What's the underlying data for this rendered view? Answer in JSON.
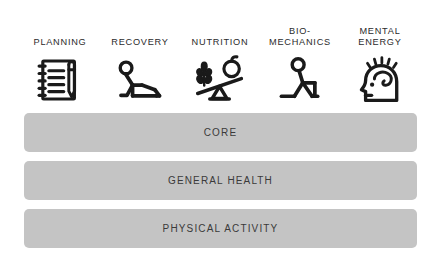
{
  "diagram": {
    "colors": {
      "background": "#ffffff",
      "icon_stroke": "#1a1a1a",
      "bar_fill": "#c4c4c4",
      "bar_text": "#3a3a3a",
      "label_text": "#2b2b2b"
    },
    "pillars": [
      {
        "label": "PLANNING",
        "icon": "notebook-pencil-icon"
      },
      {
        "label": "RECOVERY",
        "icon": "person-reclining-lounger-icon"
      },
      {
        "label": "NUTRITION",
        "icon": "balance-wheat-apple-icon"
      },
      {
        "label": "BIO-\nMECHANICS",
        "icon": "person-lunge-stretch-icon"
      },
      {
        "label": "MENTAL\nENERGY",
        "icon": "head-brain-energy-icon"
      }
    ],
    "layers": [
      {
        "label": "CORE"
      },
      {
        "label": "GENERAL HEALTH"
      },
      {
        "label": "PHYSICAL ACTIVITY"
      }
    ]
  }
}
